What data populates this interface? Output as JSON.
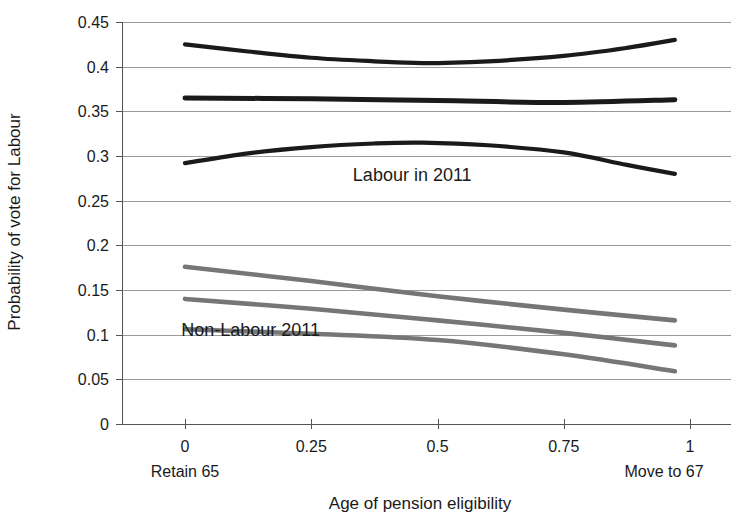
{
  "chart_data": {
    "type": "line",
    "title": "",
    "xlabel": "Age of pension eligibility",
    "ylabel": "Probability of vote for Labour",
    "xlim": [
      0,
      1
    ],
    "ylim": [
      0,
      0.45
    ],
    "grid": true,
    "legend": "none",
    "x_ticks": [
      "0",
      "0.25",
      "0.5",
      "0.75",
      "1"
    ],
    "x_tick_values": [
      0,
      0.25,
      0.5,
      0.75,
      1
    ],
    "y_ticks": [
      "0",
      "0.05",
      "0.1",
      "0.15",
      "0.2",
      "0.25",
      "0.3",
      "0.35",
      "0.4",
      "0.45"
    ],
    "y_tick_values": [
      0,
      0.05,
      0.1,
      0.15,
      0.2,
      0.25,
      0.3,
      0.35,
      0.4,
      0.45
    ],
    "x_endpoint_labels": {
      "left": "Retain 65",
      "right": "Move to 67"
    },
    "annotations": [
      {
        "text": "Labour in 2011",
        "x": 0.45,
        "y": 0.272
      },
      {
        "text": "Non-Labour 2011",
        "x": 0.13,
        "y": 0.098
      }
    ],
    "colors": {
      "labour": "#1a1a1a",
      "non_labour": "#767676",
      "gridline": "#9a9a9a",
      "axis": "#555555",
      "background": "#ffffff"
    },
    "series": [
      {
        "name": "Labour in 2011 upper bound",
        "group": "Labour in 2011",
        "color": "#1a1a1a",
        "width": 4.2,
        "x": [
          0,
          0.125,
          0.25,
          0.375,
          0.47,
          0.6,
          0.75,
          0.875,
          0.97
        ],
        "values": [
          0.425,
          0.417,
          0.41,
          0.406,
          0.404,
          0.406,
          0.412,
          0.421,
          0.43
        ]
      },
      {
        "name": "Labour in 2011 point estimate",
        "group": "Labour in 2011",
        "color": "#1a1a1a",
        "width": 5.0,
        "x": [
          0,
          0.25,
          0.5,
          0.75,
          0.97
        ],
        "values": [
          0.365,
          0.364,
          0.362,
          0.36,
          0.363
        ]
      },
      {
        "name": "Labour in 2011 lower bound",
        "group": "Labour in 2011",
        "color": "#1a1a1a",
        "width": 4.2,
        "x": [
          0,
          0.125,
          0.25,
          0.375,
          0.47,
          0.6,
          0.75,
          0.875,
          0.97
        ],
        "values": [
          0.292,
          0.303,
          0.31,
          0.314,
          0.315,
          0.312,
          0.304,
          0.29,
          0.28
        ]
      },
      {
        "name": "Non-Labour 2011 upper bound",
        "group": "Non-Labour 2011",
        "color": "#767676",
        "width": 4.6,
        "x": [
          0,
          0.25,
          0.5,
          0.75,
          0.97
        ],
        "values": [
          0.176,
          0.16,
          0.143,
          0.128,
          0.116
        ]
      },
      {
        "name": "Non-Labour 2011 point estimate",
        "group": "Non-Labour 2011",
        "color": "#767676",
        "width": 4.6,
        "x": [
          0,
          0.25,
          0.5,
          0.75,
          0.97
        ],
        "values": [
          0.14,
          0.129,
          0.116,
          0.102,
          0.088
        ]
      },
      {
        "name": "Non-Labour 2011 lower bound",
        "group": "Non-Labour 2011",
        "color": "#767676",
        "width": 4.6,
        "x": [
          0,
          0.25,
          0.5,
          0.75,
          0.97
        ],
        "values": [
          0.106,
          0.101,
          0.094,
          0.078,
          0.059
        ]
      }
    ]
  }
}
